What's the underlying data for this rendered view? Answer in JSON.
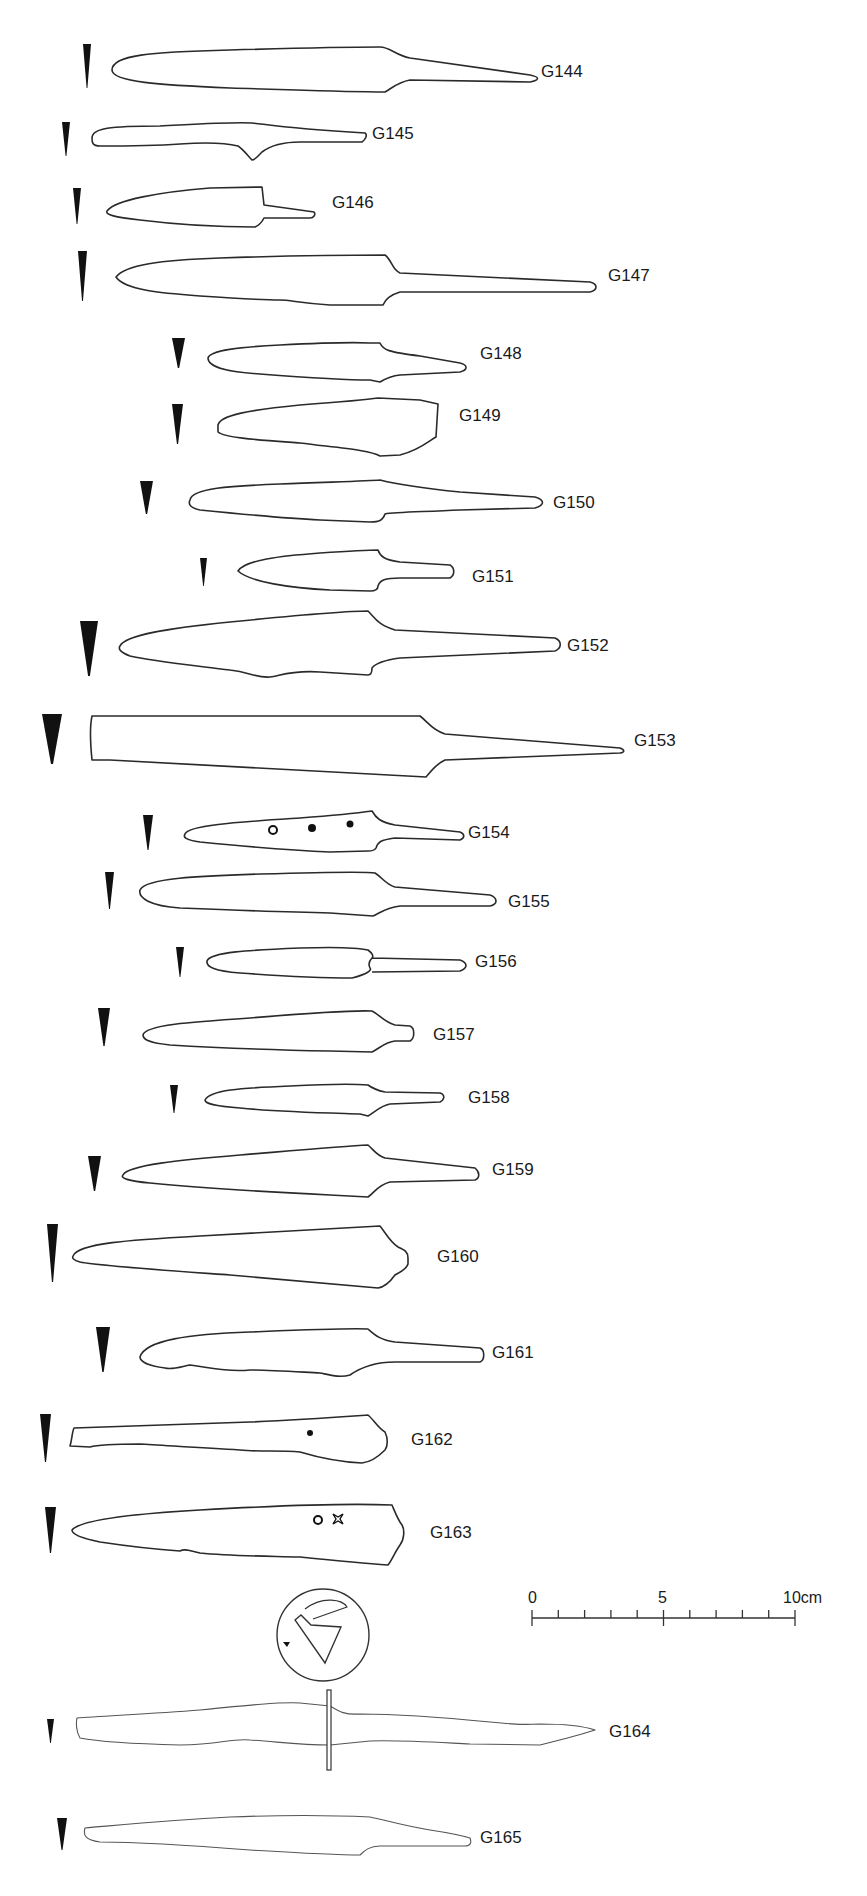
{
  "figure": {
    "header_cropped_text": ""
  },
  "scale_bar": {
    "x0": 532,
    "x1": 795,
    "y": 1618,
    "labels": [
      {
        "text": "0",
        "x": 528,
        "y": 1590
      },
      {
        "text": "5",
        "x": 658,
        "y": 1590
      },
      {
        "text": "10cm",
        "x": 783,
        "y": 1590
      }
    ],
    "divisions": 10,
    "unit": "cm",
    "max": 10
  },
  "items": [
    {
      "id": "G144",
      "label": "G144",
      "label_x": 541,
      "label_y": 72,
      "section": {
        "x": 83,
        "y": 44,
        "w": 8,
        "h": 44
      },
      "path": "M112,70 C112,55 150,52 230,50 C300,48 350,47 380,47 C390,47 395,55 410,58 L530,75 C540,77 540,80 530,82 L410,80 C398,82 392,88 385,92 C340,92 300,90 230,88 C160,85 112,82 112,70 Z"
    },
    {
      "id": "G145",
      "label": "G145",
      "label_x": 372,
      "label_y": 134,
      "section": {
        "x": 62,
        "y": 122,
        "w": 8,
        "h": 34
      },
      "path": "M92,138 C92,128 110,126 160,126 C200,124 230,122 252,123 C265,124 280,128 365,133 C368,135 365,140 362,142 L300,142 C280,142 270,146 262,152 C258,156 255,160 252,160 C248,156 244,150 238,146 C230,144 210,142 180,144 C150,146 120,146 100,146 C92,146 92,142 92,138 Z"
    },
    {
      "id": "G146",
      "label": "G146",
      "label_x": 332,
      "label_y": 203,
      "section": {
        "x": 73,
        "y": 188,
        "w": 8,
        "h": 36
      },
      "path": "M107,211 C115,200 160,192 210,188 L262,187 L264,205 L300,210 L314,212 C316,214 314,218 310,218 L300,218 L264,218 C262,222 260,225 255,227 C220,227 180,225 140,220 C115,217 105,215 107,211 Z"
    },
    {
      "id": "G147",
      "label": "G147",
      "label_x": 608,
      "label_y": 276,
      "section": {
        "x": 78,
        "y": 251,
        "w": 9,
        "h": 50
      },
      "path": "M116,277 C125,265 160,260 220,258 C280,256 340,255 385,255 C392,260 392,270 400,273 L590,282 C598,284 598,290 590,292 L400,292 C390,295 385,300 383,305 L330,305 C300,303 290,300 280,300 C260,300 230,298 200,296 C160,293 125,290 116,277 Z"
    },
    {
      "id": "G148",
      "label": "G148",
      "label_x": 480,
      "label_y": 354,
      "section": {
        "x": 172,
        "y": 338,
        "w": 13,
        "h": 30
      },
      "path": "M208,358 C210,350 240,347 280,345 C320,343 350,342 370,343 L380,343 C383,350 388,352 420,356 L460,363 C468,365 468,370 460,372 L400,375 C390,376 385,379 380,382 L370,380 C340,380 300,377 260,374 C230,372 208,368 208,358 Z"
    },
    {
      "id": "G149",
      "label": "G149",
      "label_x": 459,
      "label_y": 416,
      "section": {
        "x": 172,
        "y": 404,
        "w": 11,
        "h": 40
      },
      "path": "M218,425 C220,415 250,410 300,405 C340,402 365,400 378,398 L420,400 L438,404 L436,437 C430,440 420,450 400,455 L380,456 C370,450 340,448 300,443 C260,440 225,438 218,432 Z"
    },
    {
      "id": "G150",
      "label": "G150",
      "label_x": 553,
      "label_y": 503,
      "section": {
        "x": 140,
        "y": 481,
        "w": 13,
        "h": 33
      },
      "path": "M190,500 C192,488 230,486 280,484 C330,482 370,481 380,480 C392,483 410,487 460,492 L535,497 C545,500 545,505 535,508 L460,510 C420,512 395,512 385,514 C383,520 380,522 370,522 L320,520 C280,518 240,514 200,510 C190,508 188,504 190,500 Z"
    },
    {
      "id": "G151",
      "label": "G151",
      "label_x": 472,
      "label_y": 577,
      "section": {
        "x": 200,
        "y": 558,
        "w": 7,
        "h": 28
      },
      "path": "M238,571 C245,560 280,556 320,553 C350,551 370,550 378,550 C380,556 384,560 400,562 L450,565 C455,568 455,575 450,578 L400,578 C385,578 380,580 378,586 C378,590 375,591 370,591 L330,590 C290,588 250,582 238,571 Z"
    },
    {
      "id": "G152",
      "label": "G152",
      "label_x": 567,
      "label_y": 646,
      "section": {
        "x": 80,
        "y": 621,
        "w": 18,
        "h": 55
      },
      "path": "M120,646 C125,635 170,628 230,622 C290,616 345,611 368,611 C375,618 378,625 395,630 L555,638 C562,641 562,648 555,651 L400,658 C385,660 375,664 372,668 C372,672 371,675 368,675 L320,672 C290,670 280,676 270,677 C255,678 250,672 230,670 C190,665 150,661 130,656 C120,652 118,649 120,646 Z"
    },
    {
      "id": "G153",
      "label": "G153",
      "label_x": 634,
      "label_y": 741,
      "section": {
        "x": 42,
        "y": 714,
        "w": 20,
        "h": 50
      },
      "path": "M92,716 L420,716 C428,722 432,730 445,734 L620,748 C625,750 625,752 620,753 L445,760 C436,764 432,770 426,777 L110,760 L92,760 C90,740 90,725 92,716 Z"
    },
    {
      "id": "G154",
      "label": "G154",
      "label_x": 468,
      "label_y": 833,
      "section": {
        "x": 143,
        "y": 815,
        "w": 10,
        "h": 35
      },
      "path": "M185,834 C188,825 240,822 300,818 C340,815 365,812 372,811 C376,818 380,822 395,825 L460,832 C465,834 465,838 460,840 L395,838 C380,840 378,842 376,848 C375,850 372,851 368,851 L330,852 C280,850 240,846 200,842 C185,840 183,837 185,834 Z",
      "marks": [
        {
          "type": "ring",
          "cx": 273,
          "cy": 830,
          "r": 4
        },
        {
          "type": "dot",
          "cx": 312,
          "cy": 828,
          "r": 4
        },
        {
          "type": "dot",
          "cx": 350,
          "cy": 824,
          "r": 3.5
        }
      ]
    },
    {
      "id": "G155",
      "label": "G155",
      "label_x": 508,
      "label_y": 902,
      "section": {
        "x": 105,
        "y": 872,
        "w": 9,
        "h": 37
      },
      "path": "M140,890 C145,878 200,876 260,874 C330,872 370,872 375,873 C383,878 385,884 395,887 L490,895 C498,898 498,904 490,906 L400,906 C385,908 380,913 373,916 L330,913 C280,912 230,910 180,908 C150,906 138,898 140,890 Z"
    },
    {
      "id": "G156",
      "label": "G156",
      "label_x": 475,
      "label_y": 962,
      "section": {
        "x": 176,
        "y": 947,
        "w": 8,
        "h": 30
      },
      "path": "M207,961 C210,952 250,950 300,948 C330,947 355,947 368,950 C372,953 374,956 372,958 C370,960 368,964 370,968 C372,970 368,974 352,978 C320,978 280,976 240,973 C215,971 206,967 207,961 Z M372,958 L460,960 C468,963 468,968 460,971 L372,972"
    },
    {
      "id": "G157",
      "label": "G157",
      "label_x": 433,
      "label_y": 1035,
      "section": {
        "x": 98,
        "y": 1008,
        "w": 12,
        "h": 38
      },
      "path": "M143,1035 C145,1025 190,1022 250,1018 C310,1013 350,1010 372,1011 C380,1015 384,1022 395,1025 L410,1026 C415,1028 415,1038 410,1041 L395,1041 C385,1042 380,1048 372,1052 L330,1051 C280,1050 220,1048 170,1045 C150,1043 143,1040 143,1035 Z"
    },
    {
      "id": "G158",
      "label": "G158",
      "label_x": 468,
      "label_y": 1098,
      "section": {
        "x": 170,
        "y": 1085,
        "w": 8,
        "h": 28
      },
      "path": "M205,1100 C210,1090 240,1088 290,1086 C330,1084 355,1084 368,1085 C372,1088 375,1090 385,1092 L440,1093 C446,1095 444,1100 440,1102 L390,1104 C380,1106 375,1112 368,1116 L360,1114 C330,1113 280,1112 240,1108 C215,1106 205,1104 205,1100 Z"
    },
    {
      "id": "G159",
      "label": "G159",
      "label_x": 492,
      "label_y": 1170,
      "section": {
        "x": 88,
        "y": 1156,
        "w": 13,
        "h": 35
      },
      "path": "M123,1175 C128,1165 180,1160 240,1155 C300,1150 345,1146 368,1145 C374,1150 376,1155 385,1158 L475,1168 C480,1172 480,1178 475,1180 L390,1182 C378,1185 375,1192 368,1197 L330,1195 C270,1192 200,1188 150,1183 C128,1181 120,1178 123,1175 Z"
    },
    {
      "id": "G160",
      "label": "G160",
      "label_x": 437,
      "label_y": 1257,
      "section": {
        "x": 47,
        "y": 1224,
        "w": 11,
        "h": 58
      },
      "path": "M73,1256 C78,1243 130,1240 200,1236 C270,1232 340,1228 380,1226 C385,1232 390,1242 398,1247 C405,1250 408,1252 408,1258 L408,1264 C406,1270 400,1272 395,1275 C390,1282 385,1287 378,1288 C340,1285 290,1280 230,1275 C160,1270 100,1266 80,1262 C73,1260 72,1258 73,1256 Z"
    },
    {
      "id": "G161",
      "label": "G161",
      "label_x": 492,
      "label_y": 1353,
      "section": {
        "x": 96,
        "y": 1327,
        "w": 14,
        "h": 45
      },
      "path": "M140,1357 C145,1340 190,1334 250,1332 C300,1330 345,1328 368,1329 C375,1335 380,1340 395,1342 L480,1348 C485,1350 485,1360 480,1362 L395,1362 C375,1362 360,1368 350,1375 C340,1378 330,1375 320,1373 C300,1372 270,1370 250,1370 C230,1372 210,1368 190,1365 C180,1367 172,1370 165,1368 C150,1366 140,1362 140,1357 Z"
    },
    {
      "id": "G162",
      "label": "G162",
      "label_x": 411,
      "label_y": 1440,
      "section": {
        "x": 40,
        "y": 1414,
        "w": 11,
        "h": 48
      },
      "path": "M74,1428 L250,1422 C300,1420 340,1417 368,1415 C374,1420 378,1428 385,1432 C388,1438 388,1446 385,1450 C380,1455 372,1462 362,1463 C340,1462 320,1458 300,1452 C280,1450 260,1452 240,1450 C200,1448 160,1445 140,1444 C120,1444 100,1444 90,1447 L70,1446 C72,1440 72,1432 74,1428 Z",
      "marks": [
        {
          "type": "dot",
          "cx": 310,
          "cy": 1433,
          "r": 3
        }
      ]
    },
    {
      "id": "G163",
      "label": "G163",
      "label_x": 430,
      "label_y": 1533,
      "section": {
        "x": 45,
        "y": 1507,
        "w": 11,
        "h": 46
      },
      "path": "M72,1530 C80,1520 130,1514 200,1510 C270,1506 340,1503 392,1505 C395,1512 398,1520 402,1525 C405,1530 404,1540 400,1545 C395,1552 392,1560 388,1565 C360,1563 330,1560 300,1557 C260,1556 230,1556 200,1553 C190,1551 185,1548 180,1551 C150,1549 120,1545 100,1542 C80,1538 72,1534 72,1530 Z",
      "marks": [
        {
          "type": "ring",
          "cx": 318,
          "cy": 1520,
          "r": 4
        },
        {
          "type": "star",
          "cx": 338,
          "cy": 1519,
          "r": 5
        }
      ]
    },
    {
      "id": "G164",
      "label": "G164",
      "label_x": 609,
      "label_y": 1732,
      "section": {
        "x": 47,
        "y": 1719,
        "w": 7,
        "h": 24
      },
      "faint": true,
      "circle": {
        "cx": 323,
        "cy": 1635,
        "r": 46
      },
      "guard": {
        "x": 327,
        "y": 1690,
        "w": 4,
        "h": 80
      },
      "path": "M77,1718 C100,1716 150,1714 200,1710 C250,1705 280,1702 300,1703 L330,1706 C340,1712 345,1715 360,1714 C400,1714 450,1718 490,1722 C510,1724 520,1725 540,1724 C560,1724 580,1725 595,1730 C580,1735 560,1740 540,1745 L470,1744 C430,1742 400,1740 370,1741 L330,1745 C300,1745 280,1742 250,1740 C230,1738 220,1745 180,1745 C140,1744 100,1742 80,1738 C76,1732 76,1722 77,1718 Z"
    },
    {
      "id": "G165",
      "label": "G165",
      "label_x": 480,
      "label_y": 1838,
      "section": {
        "x": 57,
        "y": 1818,
        "w": 10,
        "h": 32
      },
      "faint": true,
      "path": "M85,1828 C120,1825 170,1820 230,1817 C280,1815 330,1815 370,1817 C385,1820 400,1825 430,1830 C450,1833 460,1835 470,1838 C472,1843 470,1846 465,1846 L380,1846 C370,1846 365,1850 360,1855 C340,1855 300,1853 250,1850 C200,1846 150,1842 100,1842 C85,1840 83,1835 85,1828 Z"
    }
  ]
}
